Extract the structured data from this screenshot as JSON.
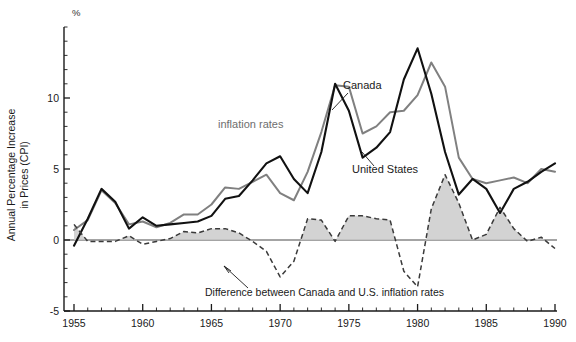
{
  "chart_data": {
    "type": "line",
    "title": "",
    "xlabel": "",
    "ylabel": "Annual Percentage Increase in Prices (CPI)",
    "unit_label": "%",
    "xlim": [
      1954,
      1990.5
    ],
    "ylim": [
      -5,
      15
    ],
    "grid": false,
    "legend_position": "inline-annotations",
    "x_ticks": [
      1955,
      1960,
      1965,
      1970,
      1975,
      1980,
      1985,
      1990
    ],
    "x_tick_labels": [
      "1955",
      "1960",
      "1965",
      "1970",
      "1975",
      "1980",
      "1985",
      "1990"
    ],
    "x_minor_tick_step": 1,
    "y_ticks": [
      -5,
      0,
      5,
      10
    ],
    "y_tick_labels": [
      "-5",
      "0",
      "5",
      "10"
    ],
    "y_minor_tick_step": 1,
    "group_label": "inflation rates",
    "annotation": "Difference between Canada and U.S. inflation rates",
    "x": [
      1955,
      1956,
      1957,
      1958,
      1959,
      1960,
      1961,
      1962,
      1963,
      1964,
      1965,
      1966,
      1967,
      1968,
      1969,
      1970,
      1971,
      1972,
      1973,
      1974,
      1975,
      1976,
      1977,
      1978,
      1979,
      1980,
      1981,
      1982,
      1983,
      1984,
      1985,
      1986,
      1987,
      1988,
      1989,
      1990
    ],
    "series": [
      {
        "name": "Canada",
        "color": "#808080",
        "style": "solid",
        "values": [
          0.7,
          1.4,
          3.5,
          2.6,
          1.1,
          1.3,
          0.9,
          1.2,
          1.8,
          1.8,
          2.5,
          3.7,
          3.6,
          4.1,
          4.6,
          3.3,
          2.8,
          4.8,
          7.6,
          10.9,
          10.8,
          7.5,
          8.0,
          9.0,
          9.1,
          10.2,
          12.5,
          10.8,
          5.8,
          4.3,
          4.0,
          4.2,
          4.4,
          4.0,
          5.0,
          4.8
        ]
      },
      {
        "name": "United States",
        "color": "#111111",
        "style": "solid",
        "values": [
          -0.4,
          1.5,
          3.6,
          2.7,
          0.8,
          1.6,
          1.0,
          1.1,
          1.2,
          1.3,
          1.7,
          2.9,
          3.1,
          4.2,
          5.4,
          5.9,
          4.3,
          3.3,
          6.2,
          11.0,
          9.1,
          5.8,
          6.5,
          7.6,
          11.3,
          13.5,
          10.3,
          6.2,
          3.2,
          4.3,
          3.6,
          1.9,
          3.6,
          4.1,
          4.8,
          5.4
        ]
      },
      {
        "name": "Difference between Canada and U.S. inflation rates",
        "color": "#3a3a3a",
        "style": "dashed",
        "values": [
          1.1,
          -0.1,
          -0.1,
          -0.1,
          0.3,
          -0.3,
          -0.1,
          0.1,
          0.6,
          0.5,
          0.8,
          0.8,
          0.5,
          -0.1,
          -0.8,
          -2.6,
          -1.5,
          1.5,
          1.4,
          -0.1,
          1.7,
          1.7,
          1.5,
          1.4,
          -2.2,
          -3.3,
          2.2,
          4.6,
          2.6,
          0.0,
          0.4,
          2.3,
          0.8,
          -0.1,
          0.2,
          -0.6
        ]
      }
    ]
  },
  "labels": {
    "canada": "Canada",
    "united_states": "United States",
    "inflation_rates": "inflation rates",
    "difference": "Difference between Canada and U.S. inflation rates",
    "percent_symbol": "%",
    "y_axis_line1": "Annual Percentage Increase",
    "y_axis_line2": "in Prices (CPI)"
  }
}
